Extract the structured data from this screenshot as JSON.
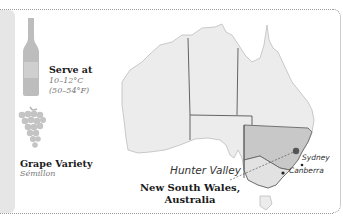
{
  "serve": {
    "title": "Serve at",
    "celsius": "10–12°C",
    "fahrenheit": "(50–54°F)",
    "icon": "wine-bottle-icon"
  },
  "grape": {
    "title": "Grape Variety",
    "name": "Sémillon",
    "icon": "grape-cluster-icon"
  },
  "map": {
    "highlight_color": "#c8c8c8",
    "land_color": "#ececec",
    "labels": {
      "subregion": "Hunter Valley",
      "city1": "Sydney",
      "city2": "Canberra"
    },
    "caption_line1": "New South Wales,",
    "caption_line2": "Australia"
  }
}
